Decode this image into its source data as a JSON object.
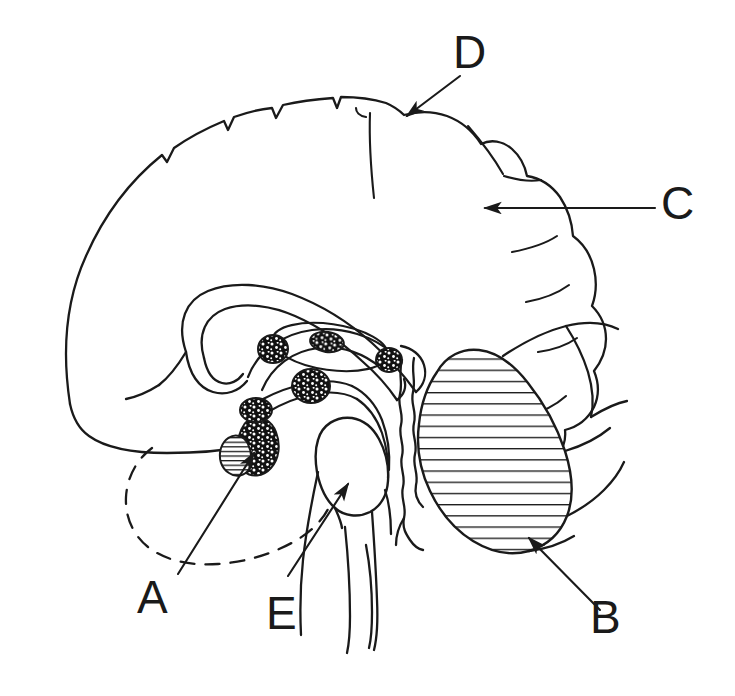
{
  "figure": {
    "background_color": "#ffffff",
    "ink_color": "#1a1a1a",
    "width": 735,
    "height": 696
  },
  "labels": [
    {
      "id": "label-a",
      "text": "A",
      "x": 139,
      "y": 578,
      "points_to": "pituitary-gland",
      "leader": "arrow",
      "arrow_from": [
        178,
        574
      ],
      "arrow_to": [
        253,
        452
      ]
    },
    {
      "id": "label-b",
      "text": "B",
      "x": 592,
      "y": 598,
      "points_to": "cerebellum",
      "leader": "arrow",
      "arrow_from": [
        592,
        604
      ],
      "arrow_to": [
        528,
        537
      ]
    },
    {
      "id": "label-c",
      "text": "C",
      "x": 663,
      "y": 182,
      "points_to": "cerebral-cortex",
      "leader": "arrow",
      "arrow_from": [
        655,
        208
      ],
      "arrow_to": [
        483,
        208
      ]
    },
    {
      "id": "label-d",
      "text": "D",
      "x": 455,
      "y": 33,
      "points_to": "central-sulcus",
      "leader": "arrow",
      "arrow_from": [
        458,
        79
      ],
      "arrow_to": [
        406,
        117
      ]
    },
    {
      "id": "label-e",
      "text": "E",
      "x": 268,
      "y": 594,
      "points_to": "pons",
      "leader": "arrow",
      "arrow_from": [
        287,
        576
      ],
      "arrow_to": [
        347,
        483
      ]
    }
  ],
  "structures": [
    {
      "id": "cerebral-cortex",
      "name": "cerebral cortex",
      "shading": "outline"
    },
    {
      "id": "central-sulcus",
      "name": "central sulcus",
      "shading": "outline"
    },
    {
      "id": "corpus-callosum",
      "name": "corpus callosum",
      "shading": "outline"
    },
    {
      "id": "thalamus",
      "name": "thalamus",
      "shading": "outline"
    },
    {
      "id": "cerebellum",
      "name": "cerebellum",
      "shading": "horizontal-hatch"
    },
    {
      "id": "pons",
      "name": "pons",
      "shading": "outline"
    },
    {
      "id": "medulla",
      "name": "medulla oblongata",
      "shading": "outline"
    },
    {
      "id": "pituitary-gland",
      "name": "pituitary gland",
      "shading": "hatch-and-stipple"
    },
    {
      "id": "temporal-lobe-dashed",
      "name": "temporal lobe (dashed outline)",
      "shading": "dashed"
    },
    {
      "id": "nucleus-1",
      "name": "stippled nucleus anterior",
      "shading": "stipple"
    },
    {
      "id": "nucleus-2",
      "name": "stippled nucleus intrathalamic",
      "shading": "stipple"
    },
    {
      "id": "nucleus-3",
      "name": "stippled nucleus posterior",
      "shading": "stipple"
    },
    {
      "id": "nucleus-4",
      "name": "stippled nucleus mid",
      "shading": "stipple"
    },
    {
      "id": "nucleus-5",
      "name": "stippled nucleus inferior",
      "shading": "stipple"
    },
    {
      "id": "nucleus-6",
      "name": "stippled nucleus pituitary stalk",
      "shading": "stipple"
    }
  ]
}
